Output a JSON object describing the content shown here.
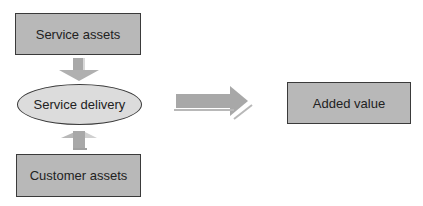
{
  "diagram": {
    "nodes": {
      "service_assets": "Service assets",
      "service_delivery": "Service delivery",
      "customer_assets": "Customer assets",
      "added_value": "Added value"
    },
    "edges": [
      {
        "from": "Service assets",
        "to": "Service delivery",
        "direction": "down"
      },
      {
        "from": "Customer assets",
        "to": "Service delivery",
        "direction": "up"
      },
      {
        "from": "Service delivery",
        "to": "Added value",
        "direction": "right"
      }
    ],
    "colors": {
      "box_fill": "#b8b8b8",
      "ellipse_fill": "#dcdcdc",
      "arrow_fill": "#a8a8a8",
      "border": "#3a3a3a"
    }
  }
}
